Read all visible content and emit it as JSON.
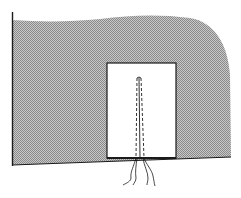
{
  "figure": {
    "colors": {
      "background": "#ffffff",
      "fabric_fill": "#9a9a9a",
      "fabric_light": "#c8c8c8",
      "outline": "#1a1a1a",
      "placket_fill": "#ffffff"
    }
  }
}
